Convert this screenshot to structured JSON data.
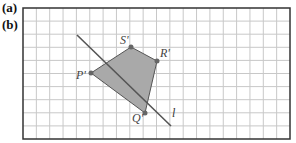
{
  "labels": {
    "a": "(a)",
    "b": "(b)"
  },
  "grid": {
    "x0": 23,
    "y0": 8,
    "x1": 290,
    "y1": 139,
    "cols": 20,
    "rows": 10,
    "line_color": "#c8c8c8",
    "border_color": "#333333"
  },
  "polygon": {
    "fill": "#a9a9a9",
    "stroke": "#555555",
    "points": [
      {
        "name": "P'",
        "x": 91,
        "y": 73,
        "lx": 76,
        "ly": 79
      },
      {
        "name": "S'",
        "x": 131,
        "y": 47,
        "lx": 120,
        "ly": 44
      },
      {
        "name": "R'",
        "x": 157,
        "y": 61,
        "lx": 160,
        "ly": 57
      },
      {
        "name": "Q'",
        "x": 145,
        "y": 113,
        "lx": 132,
        "ly": 122
      }
    ]
  },
  "mirror_line": {
    "name": "l",
    "x1": 77,
    "y1": 35,
    "x2": 171,
    "y2": 126,
    "lx": 172,
    "ly": 117
  }
}
